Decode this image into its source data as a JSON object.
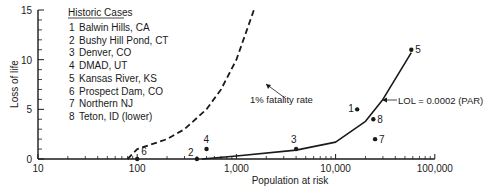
{
  "chart_data": {
    "type": "scatter",
    "title": "",
    "xlabel": "Population at risk",
    "ylabel": "Loss of life",
    "xscale": "log",
    "xlim": [
      10,
      100000
    ],
    "ylim": [
      0,
      15
    ],
    "x_ticks": [
      "10",
      "100",
      "1,000",
      "10,000",
      "100,000"
    ],
    "y_ticks": [
      "0",
      "5",
      "10",
      "15"
    ],
    "grid": false,
    "legend": {
      "title": "Historic Cases",
      "position": "upper-left",
      "entries": [
        {
          "id": "1",
          "label": "Balwin Hills, CA"
        },
        {
          "id": "2",
          "label": "Bushy Hill Pond, CT"
        },
        {
          "id": "3",
          "label": "Denver, CO"
        },
        {
          "id": "4",
          "label": "DMAD, UT"
        },
        {
          "id": "5",
          "label": "Kansas River, KS"
        },
        {
          "id": "6",
          "label": "Prospect Dam, CO"
        },
        {
          "id": "7",
          "label": "Northern NJ"
        },
        {
          "id": "8",
          "label": "Teton, ID (lower)"
        }
      ]
    },
    "points": [
      {
        "id": "1",
        "name": "Balwin Hills, CA",
        "x": 16500,
        "y": 5
      },
      {
        "id": "2",
        "name": "Bushy Hill Pond, CT",
        "x": 400,
        "y": 0
      },
      {
        "id": "3",
        "name": "Denver, CO",
        "x": 4000,
        "y": 1
      },
      {
        "id": "4",
        "name": "DMAD, UT",
        "x": 500,
        "y": 1
      },
      {
        "id": "5",
        "name": "Kansas River, KS",
        "x": 58000,
        "y": 11
      },
      {
        "id": "6",
        "name": "Prospect Dam, CO",
        "x": 100,
        "y": 0
      },
      {
        "id": "7",
        "name": "Northern NJ",
        "x": 25000,
        "y": 2
      },
      {
        "id": "8",
        "name": "Teton, ID (lower)",
        "x": 24000,
        "y": 4
      }
    ],
    "series": [
      {
        "name": "1% fatality rate",
        "style": "dashed",
        "x": [
          80,
          100,
          200,
          300,
          500,
          700,
          1000,
          1500
        ],
        "y": [
          0,
          1,
          2,
          3,
          5,
          7,
          10,
          15
        ]
      },
      {
        "name": "LOL = 0.0002 (PAR)",
        "style": "solid",
        "x": [
          450,
          1000,
          4000,
          10000,
          20000,
          30000,
          58000
        ],
        "y": [
          0,
          0.3,
          0.9,
          1.7,
          3.8,
          6,
          10.7
        ]
      }
    ],
    "annotations": [
      {
        "text": "1% fatality rate",
        "arrow_to": "dashed curve"
      },
      {
        "text": "LOL = 0.0002 (PAR)",
        "arrow_to": "solid curve"
      }
    ]
  },
  "colors": {
    "ink": "#1a1a1a",
    "background": "#ffffff"
  }
}
